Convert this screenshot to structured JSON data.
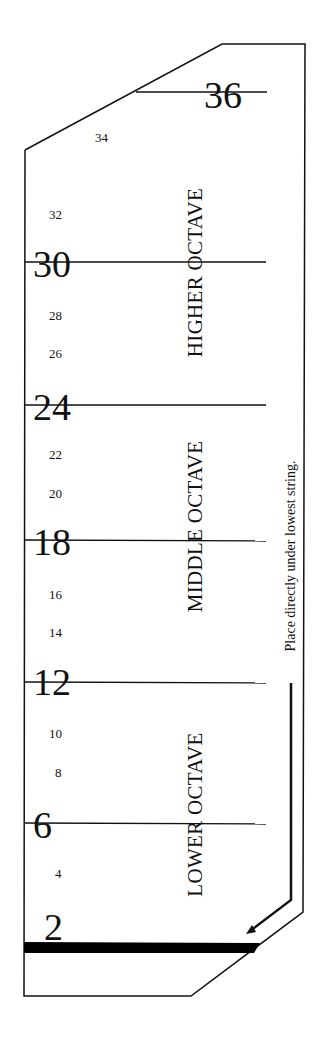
{
  "template": {
    "instruction": "Place directly under lowest string.",
    "octaves": [
      {
        "label": "HIGHER OCTAVE"
      },
      {
        "label": "MIDDLE OCTAVE"
      },
      {
        "label": "LOWER OCTAVE"
      }
    ],
    "major_marks": [
      "36",
      "30",
      "24",
      "18",
      "12",
      "6",
      "2"
    ],
    "minor_marks": [
      "34",
      "32",
      "28",
      "26",
      "22",
      "20",
      "16",
      "14",
      "10",
      "8",
      "4"
    ],
    "colors": {
      "line": "#111111",
      "background": "#ffffff"
    }
  }
}
